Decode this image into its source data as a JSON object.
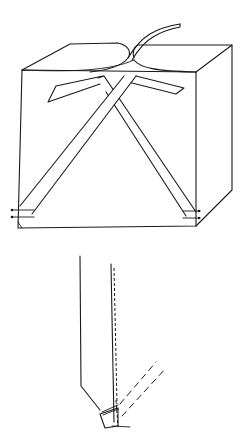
{
  "figure": {
    "background": "#ffffff",
    "ink_color": "#1a1a1a",
    "panels": [
      {
        "id": "box",
        "description": "Box with crossed straps tied over the top, handle strap rising from top center"
      },
      {
        "id": "strap-detail",
        "description": "Close-up of strap end folded and stitched at base, dashed lines showing strap continuation"
      }
    ]
  }
}
